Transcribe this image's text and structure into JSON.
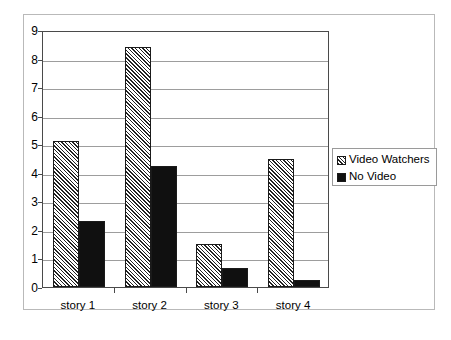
{
  "chart_data": {
    "type": "bar",
    "title": "",
    "subtitle": "",
    "xlabel": "",
    "ylabel": "",
    "categories": [
      "story 1",
      "story 2",
      "story 3",
      "story 4"
    ],
    "series": [
      {
        "name": "Video Watchers",
        "fill": "hatched-diagonal",
        "color": "#222222",
        "values": [
          5.1,
          8.4,
          1.5,
          4.5
        ]
      },
      {
        "name": "No Video",
        "fill": "solid",
        "color": "#101010",
        "values": [
          2.3,
          4.25,
          0.65,
          0.25
        ]
      }
    ],
    "ylim": [
      0,
      9
    ],
    "ytick_step": 1,
    "yticks": [
      0,
      1,
      2,
      3,
      4,
      5,
      6,
      7,
      8,
      9
    ],
    "ytick_labels": [
      "0",
      "1",
      "2",
      "3",
      "4",
      "5",
      "6",
      "7",
      "8",
      "9"
    ],
    "grid": true,
    "grid_axis": "y",
    "grid_color": "#9d9d9d",
    "legend": {
      "position": "right",
      "entries": [
        "Video Watchers",
        "No Video"
      ]
    },
    "plot_border_color": "#4a4a4a",
    "figure_border_color": "#b9b9b9",
    "background": "#ffffff"
  }
}
